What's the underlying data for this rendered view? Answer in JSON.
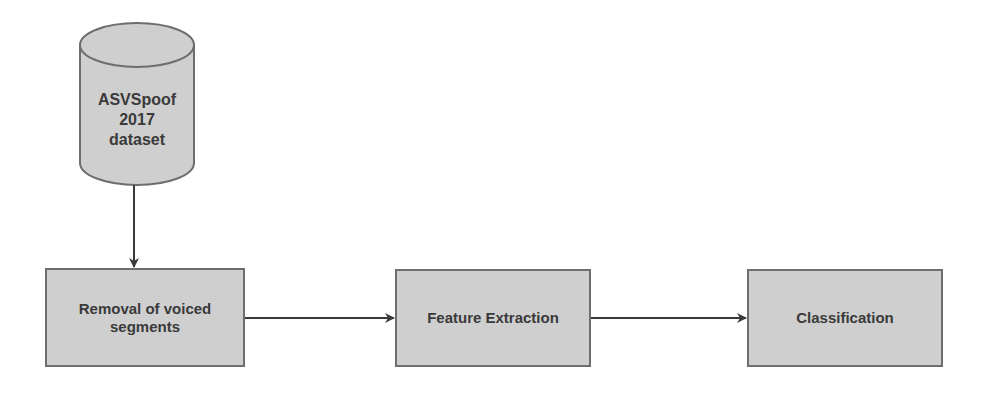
{
  "diagram": {
    "type": "flowchart",
    "colors": {
      "node_fill": "#cfcfcf",
      "node_stroke": "#6e6e6e",
      "text": "#3a3a3a",
      "arrow": "#3a3a3a",
      "background": "#ffffff"
    },
    "nodes": [
      {
        "id": "dataset",
        "shape": "cylinder",
        "label": "ASVSpoof 2017 dataset",
        "lines": [
          "ASVSpoof",
          "2017",
          "dataset"
        ]
      },
      {
        "id": "removal",
        "shape": "rectangle",
        "label": "Removal of voiced segments",
        "lines": [
          "Removal of voiced",
          "segments"
        ]
      },
      {
        "id": "features",
        "shape": "rectangle",
        "label": "Feature Extraction",
        "lines": [
          "Feature Extraction"
        ]
      },
      {
        "id": "classify",
        "shape": "rectangle",
        "label": "Classification",
        "lines": [
          "Classification"
        ]
      }
    ],
    "edges": [
      {
        "from": "dataset",
        "to": "removal",
        "direction": "down"
      },
      {
        "from": "removal",
        "to": "features",
        "direction": "right"
      },
      {
        "from": "features",
        "to": "classify",
        "direction": "right"
      }
    ]
  }
}
